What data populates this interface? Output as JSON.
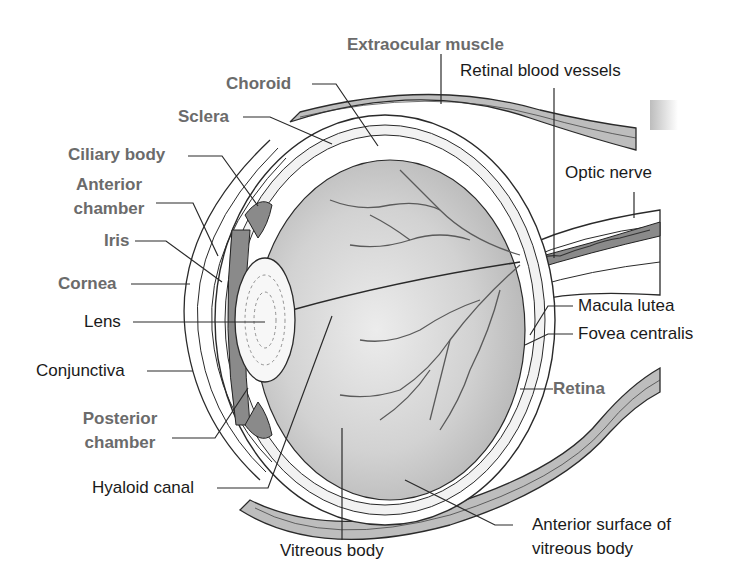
{
  "diagram": {
    "colors": {
      "bold_label": "#6b6b6b",
      "plain_label": "#1a1a1a",
      "vitreous": "#c8c8c8",
      "muscle": "#bdbdbd",
      "iris": "#8a8a8a",
      "vessel": "#5a5a5a",
      "outline": "#2a2a2a"
    },
    "labels": {
      "extraocular_muscle": "Extraocular muscle",
      "retinal_blood_vessels": "Retinal blood vessels",
      "choroid": "Choroid",
      "sclera": "Sclera",
      "ciliary_body": "Ciliary body",
      "anterior_chamber_1": "Anterior",
      "anterior_chamber_2": "chamber",
      "optic_nerve": "Optic nerve",
      "iris": "Iris",
      "cornea": "Cornea",
      "lens": "Lens",
      "macula_lutea": "Macula lutea",
      "fovea_centralis": "Fovea centralis",
      "conjunctiva": "Conjunctiva",
      "retina": "Retina",
      "posterior_chamber_1": "Posterior",
      "posterior_chamber_2": "chamber",
      "hyaloid_canal": "Hyaloid canal",
      "anterior_surface_1": "Anterior surface of",
      "anterior_surface_2": "vitreous body",
      "vitreous_body": "Vitreous body"
    }
  }
}
